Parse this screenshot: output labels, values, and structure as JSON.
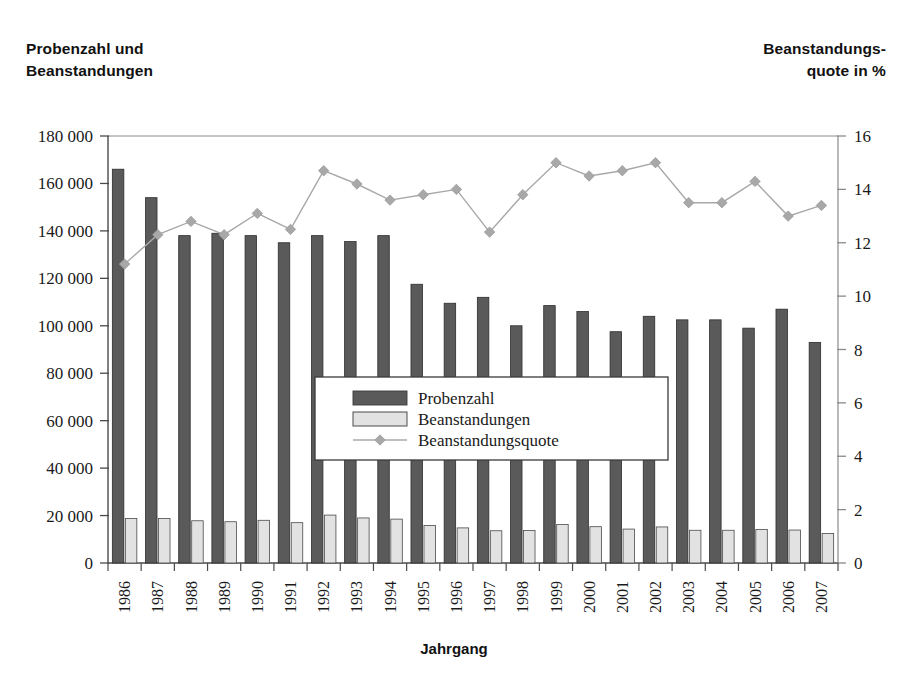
{
  "titles": {
    "left_line1": "Probenzahl und",
    "left_line2": "Beanstandungen",
    "right_line1": "Beanstandungs-",
    "right_line2": "quote in %"
  },
  "axis_title_x": "Jahrgang",
  "colors": {
    "bar_probenzahl": "#5a5a5a",
    "bar_beanstandungen": "#e2e2e2",
    "line_quote": "#a8a8a8",
    "axis": "#8a8a8a",
    "text": "#1a1a1a",
    "background": "#ffffff"
  },
  "legend": {
    "items": [
      {
        "label": "Probenzahl",
        "type": "bar",
        "color": "#5a5a5a"
      },
      {
        "label": "Beanstandungen",
        "type": "bar",
        "color": "#e2e2e2"
      },
      {
        "label": "Beanstandungsquote",
        "type": "line",
        "color": "#a8a8a8"
      }
    ]
  },
  "chart_data": {
    "type": "bar",
    "title": "",
    "xlabel": "Jahrgang",
    "ylabel": "Probenzahl und Beanstandungen",
    "y2label": "Beanstandungsquote in %",
    "grid": false,
    "legend_position": "center",
    "ylim": [
      0,
      180000
    ],
    "y2lim": [
      0,
      16
    ],
    "yticks": [
      0,
      20000,
      40000,
      60000,
      80000,
      100000,
      120000,
      140000,
      160000,
      180000
    ],
    "ytick_labels": [
      "0",
      "20 000",
      "40 000",
      "60 000",
      "80 000",
      "100 000",
      "120 000",
      "140 000",
      "160 000",
      "180 000"
    ],
    "y2ticks": [
      0,
      2,
      4,
      6,
      8,
      10,
      12,
      14,
      16
    ],
    "y2tick_labels": [
      "0",
      "2",
      "4",
      "6",
      "8",
      "10",
      "12",
      "14",
      "16"
    ],
    "categories": [
      "1986",
      "1987",
      "1988",
      "1989",
      "1990",
      "1991",
      "1992",
      "1993",
      "1994",
      "1995",
      "1996",
      "1997",
      "1998",
      "1999",
      "2000",
      "2001",
      "2002",
      "2003",
      "2004",
      "2005",
      "2006",
      "2007"
    ],
    "series": [
      {
        "name": "Probenzahl",
        "kind": "bar",
        "axis": "left",
        "color": "#5a5a5a",
        "values": [
          166000,
          154000,
          138000,
          139000,
          138000,
          135000,
          138000,
          135500,
          138000,
          117500,
          109500,
          112000,
          100000,
          108500,
          106000,
          97500,
          104000,
          102500,
          102500,
          99000,
          107000,
          93000
        ]
      },
      {
        "name": "Beanstandungen",
        "kind": "bar",
        "axis": "left",
        "color": "#e2e2e2",
        "values": [
          18800,
          18800,
          17800,
          17400,
          18000,
          17000,
          20200,
          19000,
          18500,
          15800,
          14800,
          13600,
          13700,
          16200,
          15300,
          14300,
          15200,
          13800,
          13800,
          14100,
          13900,
          12400
        ]
      },
      {
        "name": "Beanstandungsquote",
        "kind": "line",
        "axis": "right",
        "color": "#a8a8a8",
        "values": [
          11.2,
          12.3,
          12.8,
          12.3,
          13.1,
          12.5,
          14.7,
          14.2,
          13.6,
          13.8,
          14.0,
          12.4,
          13.8,
          15.0,
          14.5,
          14.7,
          15.0,
          13.5,
          13.5,
          14.3,
          13.0,
          13.4
        ]
      }
    ]
  }
}
